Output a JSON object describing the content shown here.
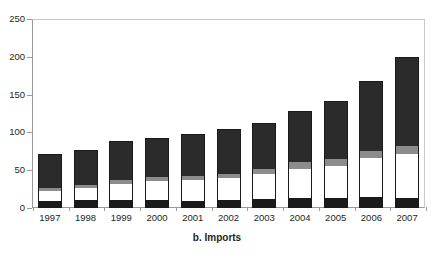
{
  "chart_data": {
    "type": "bar",
    "stacked": true,
    "title": "",
    "caption": "b. Imports",
    "xlabel": "",
    "ylabel": "",
    "ylim": [
      0,
      250
    ],
    "yticks": [
      0,
      50,
      100,
      150,
      200,
      250
    ],
    "ytick_labels": [
      "0",
      "50",
      "100",
      "150",
      "200",
      "250"
    ],
    "grid": false,
    "legend": "none",
    "categories": [
      "1997",
      "1998",
      "1999",
      "2000",
      "2001",
      "2002",
      "2003",
      "2004",
      "2005",
      "2006",
      "2007"
    ],
    "series": [
      {
        "name": "segment-1",
        "color": "#1a1a1a",
        "values": [
          9,
          10,
          10,
          11,
          9,
          11,
          12,
          13,
          13,
          14,
          13
        ]
      },
      {
        "name": "segment-2",
        "color": "#ffffff",
        "values": [
          13,
          16,
          22,
          25,
          28,
          29,
          33,
          39,
          43,
          52,
          59
        ]
      },
      {
        "name": "segment-3",
        "color": "#8c8c8c",
        "values": [
          5,
          5,
          5,
          5,
          5,
          5,
          6,
          9,
          9,
          9,
          10
        ]
      },
      {
        "name": "segment-4",
        "color": "#2b2b2b",
        "values": [
          44,
          46,
          52,
          51,
          56,
          60,
          62,
          68,
          76,
          93,
          118
        ]
      }
    ],
    "totals": [
      71,
      77,
      89,
      92,
      98,
      105,
      113,
      129,
      141,
      168,
      200
    ]
  },
  "axis": {
    "y_axis_color": "#9a9a9a",
    "frame_color": "#c9c9c9",
    "text_color": "#231f20"
  }
}
